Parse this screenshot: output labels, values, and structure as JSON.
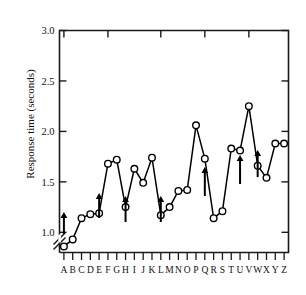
{
  "chart_data": {
    "type": "line",
    "title": "",
    "xlabel": "",
    "ylabel": "Response time (seconds)",
    "categories": [
      "A",
      "B",
      "C",
      "D",
      "E",
      "F",
      "G",
      "H",
      "I",
      "J",
      "K",
      "L",
      "M",
      "N",
      "O",
      "P",
      "Q",
      "R",
      "S",
      "T",
      "U",
      "V",
      "W",
      "X",
      "Y",
      "Z"
    ],
    "values": [
      0.86,
      0.93,
      1.14,
      1.18,
      1.19,
      1.68,
      1.72,
      1.25,
      1.63,
      1.49,
      1.74,
      1.17,
      1.25,
      1.41,
      1.42,
      2.06,
      1.73,
      1.14,
      1.21,
      1.83,
      1.81,
      2.25,
      1.66,
      1.54,
      1.88,
      1.88
    ],
    "series": [
      {
        "name": "Response time",
        "values": [
          0.86,
          0.93,
          1.14,
          1.18,
          1.19,
          1.68,
          1.72,
          1.25,
          1.63,
          1.49,
          1.74,
          1.17,
          1.25,
          1.41,
          1.42,
          2.06,
          1.73,
          1.14,
          1.21,
          1.83,
          1.81,
          2.25,
          1.66,
          1.54,
          1.88,
          1.88
        ]
      }
    ],
    "y_ticks": [
      "1.0",
      "1.5",
      "2.0",
      "2.5",
      "3.0"
    ],
    "y_tick_values": [
      1.0,
      1.5,
      2.0,
      2.5,
      3.0
    ],
    "ylim": [
      0.8,
      3.0
    ],
    "axis_break": true,
    "grid": false,
    "legend": null,
    "marker": "open-circle",
    "annotations": {
      "type": "arrow-up",
      "at_categories": [
        "A",
        "E",
        "H",
        "L",
        "Q",
        "U",
        "W"
      ],
      "count": 7
    },
    "colors": {
      "line": "#000000",
      "marker_fill": "#ffffff",
      "marker_stroke": "#000000",
      "axis": "#1a1a1a",
      "background": "#ffffff"
    }
  }
}
